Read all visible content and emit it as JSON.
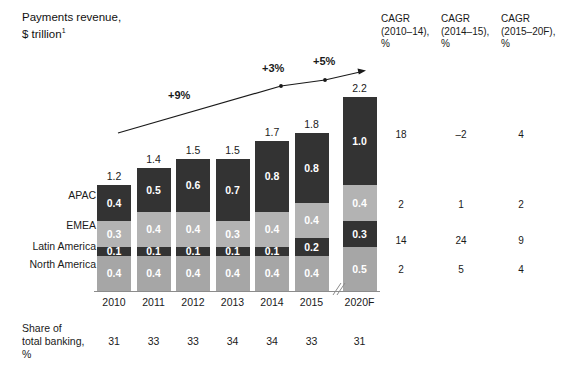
{
  "title": {
    "line1": "Payments revenue,",
    "line2": "$ trillion",
    "footnote_marker": "1"
  },
  "chart_data": {
    "type": "bar",
    "stacked": true,
    "title": "Payments revenue, $ trillion",
    "xlabel": "",
    "ylabel": "$ trillion",
    "grid": false,
    "legend_position": "left-row-labels",
    "categories": [
      "2010",
      "2011",
      "2012",
      "2013",
      "2014",
      "2015",
      "2020F"
    ],
    "series": [
      {
        "name": "APAC",
        "values": [
          0.4,
          0.5,
          0.6,
          0.7,
          0.8,
          0.8,
          1.0
        ],
        "color": "#333333"
      },
      {
        "name": "EMEA",
        "values": [
          0.3,
          0.4,
          0.4,
          0.3,
          0.4,
          0.4,
          0.4
        ],
        "color": "#b3b3b3"
      },
      {
        "name": "Latin America",
        "values": [
          0.1,
          0.1,
          0.1,
          0.1,
          0.1,
          0.2,
          0.3
        ],
        "color": "#333333"
      },
      {
        "name": "North America",
        "values": [
          0.4,
          0.4,
          0.4,
          0.4,
          0.4,
          0.4,
          0.5
        ],
        "color": "#a6a6a6"
      }
    ],
    "totals": [
      1.2,
      1.4,
      1.5,
      1.5,
      1.7,
      1.8,
      2.2
    ],
    "ylim": [
      0,
      2.2
    ],
    "annotations": [
      {
        "text": "+9%",
        "kind": "growth-arrow-segment"
      },
      {
        "text": "+3%",
        "kind": "growth-arrow-segment"
      },
      {
        "text": "+5%",
        "kind": "growth-arrow-segment"
      }
    ],
    "axis_break": true
  },
  "cagr": {
    "headers": [
      {
        "line1": "CAGR",
        "line2": "(2010–14),",
        "line3": "%"
      },
      {
        "line1": "CAGR",
        "line2": "(2014–15),",
        "line3": "%"
      },
      {
        "line1": "CAGR",
        "line2": "(2015–20F),",
        "line3": "%"
      }
    ],
    "rows": [
      {
        "series": "APAC",
        "values": [
          "18",
          "–2",
          "4"
        ]
      },
      {
        "series": "EMEA",
        "values": [
          "2",
          "1",
          "2"
        ]
      },
      {
        "series": "Latin America",
        "values": [
          "14",
          "24",
          "9"
        ]
      },
      {
        "series": "North America",
        "values": [
          "2",
          "5",
          "4"
        ]
      }
    ]
  },
  "share_row": {
    "label_line1": "Share of",
    "label_line2": "total banking,",
    "label_line3": "%",
    "values": [
      "31",
      "33",
      "33",
      "34",
      "34",
      "33",
      "31"
    ]
  },
  "colors": {
    "apac": "#333333",
    "emea": "#b3b3b3",
    "latin_america": "#333333",
    "north_america": "#a6a6a6",
    "text": "#1a1a1a",
    "axis": "#8c8c8c",
    "background": "#ffffff"
  }
}
